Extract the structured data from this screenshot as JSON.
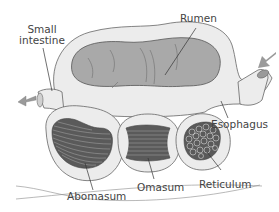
{
  "diagram": {
    "labels": {
      "small_intestine": "Small\nintestine",
      "small_intestine_line1": "Small",
      "small_intestine_line2": "intestine",
      "rumen": "Rumen",
      "esophagus": "Esophagus",
      "reticulum": "Reticulum",
      "omasum": "Omasum",
      "abomasum": "Abomasum"
    },
    "arrows": [
      {
        "name": "food-in-arrow",
        "direction": "into esophagus"
      },
      {
        "name": "food-out-arrow",
        "direction": "out of small intestine"
      }
    ],
    "colors": {
      "wall": "#ececec",
      "outline": "#666666",
      "rumen_fill": "#a9a9a9",
      "chamber_dark": "#5a5a5a",
      "arrow": "#9a9a9a",
      "leader_line": "#333333"
    }
  }
}
